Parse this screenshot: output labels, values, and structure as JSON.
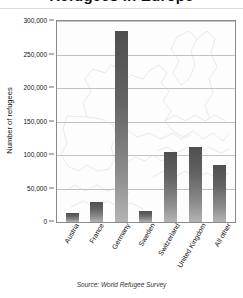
{
  "title": "Refugees in Europe",
  "source_note": "Source: World Refugee Survey",
  "axis": {
    "ylabel": "Number of refugees"
  },
  "chart_data": {
    "type": "bar",
    "title": "Refugees in Europe",
    "xlabel": "",
    "ylabel": "Number of refugees",
    "ylim": [
      0,
      300000
    ],
    "yticks": [
      0,
      50000,
      100000,
      150000,
      200000,
      250000,
      300000
    ],
    "ytick_labels": [
      "0",
      "50,000",
      "100,000",
      "150,000",
      "200,000",
      "250,000",
      "300,000"
    ],
    "grid": true,
    "legend": "none",
    "background": "faint grayscale map of Europe",
    "bar_color": "#5a5a5a",
    "categories": [
      "Austria",
      "France",
      "Germany",
      "Sweden",
      "Switzerland",
      "United Kingdom",
      "All other"
    ],
    "values": [
      14000,
      30000,
      285000,
      16000,
      105000,
      112000,
      85000
    ]
  }
}
